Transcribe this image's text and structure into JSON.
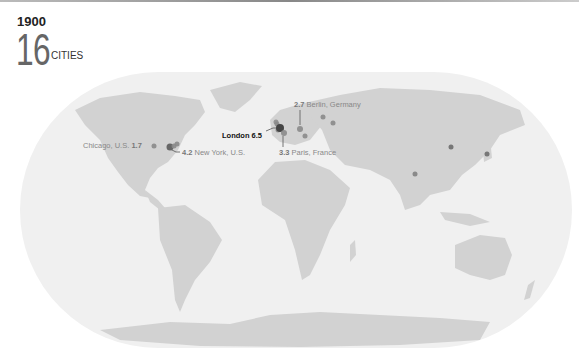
{
  "header": {
    "year": "1900",
    "count": "16",
    "count_label": "CITIES"
  },
  "colors": {
    "ocean": "#f0f0f0",
    "land": "#d2d2d2",
    "dot": "#8a8a8a",
    "dot_major": "#444444"
  },
  "cities": [
    {
      "name": "London",
      "value": "6.5",
      "label": "London",
      "x": 280,
      "y": 128,
      "r": 4,
      "highlight": true
    },
    {
      "name": "New York",
      "value": "4.2",
      "label": "New York, U.S.",
      "x": 170,
      "y": 147,
      "r": 3.5
    },
    {
      "name": "Paris",
      "value": "3.3",
      "label": "Paris, France",
      "x": 284,
      "y": 133,
      "r": 3
    },
    {
      "name": "Berlin",
      "value": "2.7",
      "label": "Berlin, Germany",
      "x": 300,
      "y": 129,
      "r": 3
    },
    {
      "name": "Chicago",
      "value": "1.7",
      "label": "Chicago, U.S.",
      "x": 154,
      "y": 146,
      "r": 2.5
    },
    {
      "name": "Vienna",
      "x": 305,
      "y": 136,
      "r": 2.5
    },
    {
      "name": "St. Petersburg",
      "x": 323,
      "y": 117,
      "r": 2.5
    },
    {
      "name": "Moscow",
      "x": 333,
      "y": 123,
      "r": 2.5
    },
    {
      "name": "Beijing",
      "x": 451,
      "y": 147,
      "r": 2.5
    },
    {
      "name": "Tokyo",
      "x": 487,
      "y": 154,
      "r": 2.5
    },
    {
      "name": "Calcutta",
      "x": 415,
      "y": 174,
      "r": 2.5
    },
    {
      "name": "Philadelphia",
      "x": 174,
      "y": 146,
      "r": 2.5
    },
    {
      "name": "Boston",
      "x": 177,
      "y": 144,
      "r": 2.5
    },
    {
      "name": "Manchester",
      "x": 277,
      "y": 124,
      "r": 2.5
    },
    {
      "name": "Birmingham",
      "x": 278,
      "y": 130,
      "r": 2.5
    },
    {
      "name": "Glasgow",
      "x": 276,
      "y": 122,
      "r": 2.5
    }
  ],
  "labels": {
    "london": {
      "name": "London",
      "value": "6.5"
    },
    "new_york": {
      "value": "4.2",
      "name": "New York, U.S."
    },
    "paris": {
      "value": "3.3",
      "name": "Paris, France"
    },
    "berlin": {
      "value": "2.7",
      "name": "Berlin, Germany"
    },
    "chicago": {
      "name": "Chicago, U.S.",
      "value": "1.7"
    }
  }
}
